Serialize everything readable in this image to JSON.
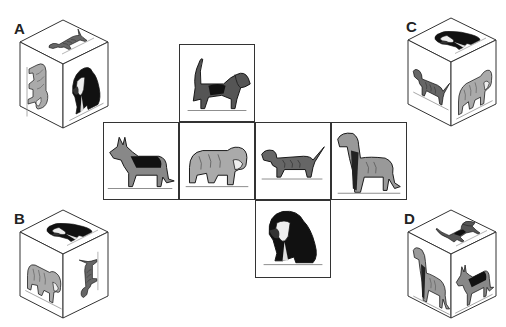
{
  "net": {
    "squares": [
      {
        "position": "top",
        "dog": "beagle",
        "row": 0,
        "col": 1
      },
      {
        "position": "left",
        "dog": "german-shepherd",
        "row": 1,
        "col": 0
      },
      {
        "position": "center",
        "dog": "bulldog",
        "row": 1,
        "col": 1
      },
      {
        "position": "center-right",
        "dog": "dachshund",
        "row": 1,
        "col": 2
      },
      {
        "position": "right",
        "dog": "great-dane",
        "row": 1,
        "col": 3
      },
      {
        "position": "bottom",
        "dog": "basset-hound",
        "row": 2,
        "col": 2
      }
    ]
  },
  "options": [
    {
      "label": "A",
      "faces": {
        "top": "dachshund",
        "left": "bulldog",
        "right": "basset-hound"
      }
    },
    {
      "label": "B",
      "faces": {
        "top": "basset-hound",
        "left": "bulldog",
        "right": "dachshund"
      }
    },
    {
      "label": "C",
      "faces": {
        "top": "basset-hound",
        "left": "dachshund",
        "right": "bulldog"
      }
    },
    {
      "label": "D",
      "faces": {
        "top": "beagle",
        "left": "great-dane",
        "right": "german-shepherd"
      }
    }
  ]
}
